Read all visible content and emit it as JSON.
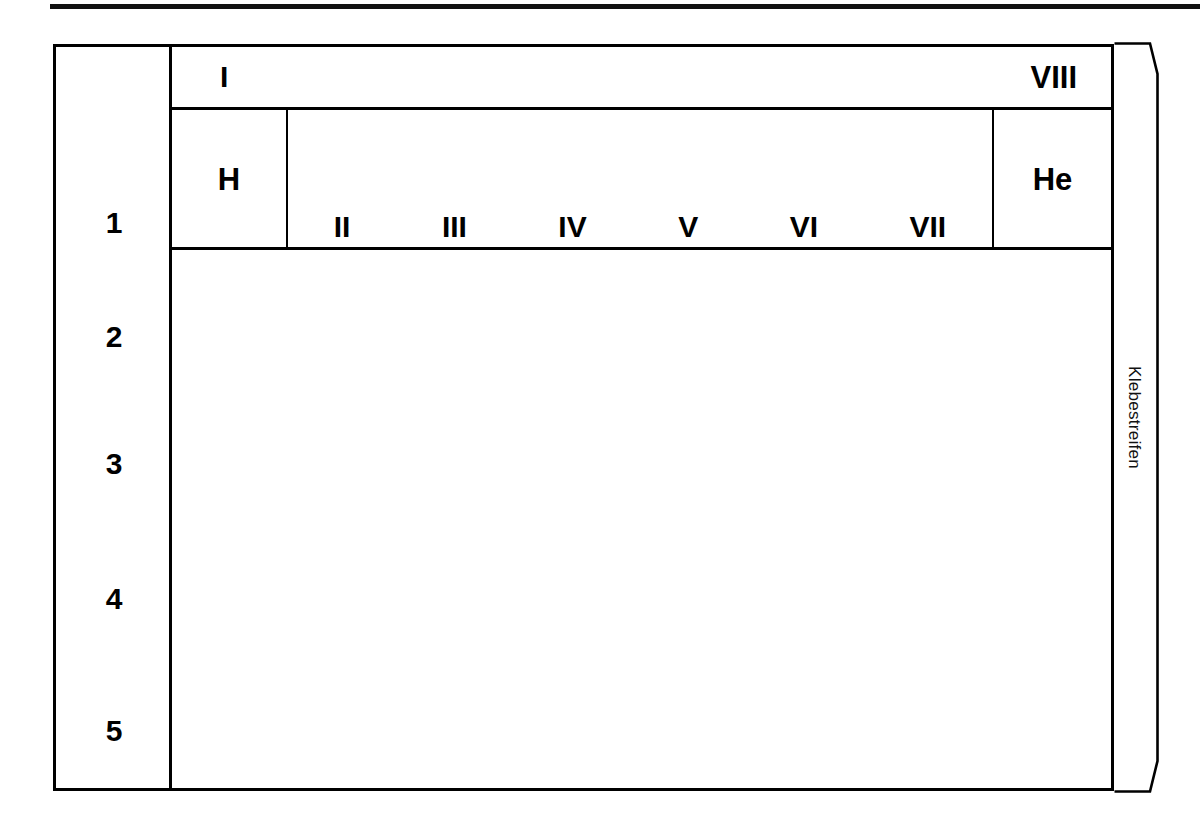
{
  "document": {
    "title": "Periodensystem Blankovorlage",
    "top_rule": true
  },
  "worksheet": {
    "period_label_column": {
      "name": "Perioden",
      "periods": [
        "1",
        "2",
        "3",
        "4",
        "5"
      ]
    },
    "group_header_row": {
      "left_group": "I",
      "right_group": "VIII"
    },
    "first_period_row": {
      "hydrogen_cell": "H",
      "subgroup_labels": [
        "II",
        "III",
        "IV",
        "V",
        "VI",
        "VII"
      ],
      "helium_cell": "He"
    },
    "work_area": {
      "content": "",
      "empty": true
    }
  },
  "glue_strip": {
    "label": "Klebestreifen",
    "orientation": "vertical",
    "beveled_corners": [
      "top-right",
      "bottom-right"
    ]
  },
  "colors": {
    "ink": "#000000",
    "paper": "#ffffff",
    "rule": "#111111"
  }
}
